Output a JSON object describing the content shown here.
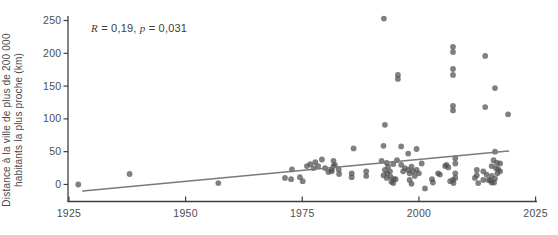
{
  "figure": {
    "background": "#ffffff"
  },
  "annotation_parts": {
    "r_label": "R",
    "r_rest": " = 0,19, ",
    "p_label": "p",
    "p_rest": " = 0,031"
  },
  "chart_data": {
    "type": "scatter",
    "title": "",
    "xlabel": "",
    "ylabel_line1": "Distance à la ville de plus de 200 000",
    "ylabel_line2": "habitants la plus proche (km)",
    "annotation": "R = 0,19, p = 0,031",
    "legend": "none",
    "grid": "off",
    "x_ticks": [
      1925,
      1950,
      1975,
      2000,
      2025
    ],
    "y_ticks": [
      0,
      50,
      100,
      150,
      200,
      250
    ],
    "xlim": [
      1924.8,
      2025.3
    ],
    "ylim": [
      -26,
      263
    ],
    "point_color": "#4f4f4f",
    "point_opacity": 0.72,
    "line_color": "#7a7a7a",
    "axis_color": "#3f3f3f",
    "trend_line": {
      "x1": 1928,
      "y1": -10,
      "x2": 2019.2,
      "y2": 51
    },
    "points": [
      [
        1927,
        0
      ],
      [
        1938,
        16
      ],
      [
        1957,
        2
      ],
      [
        1971.3,
        10
      ],
      [
        1972.6,
        8
      ],
      [
        1972.8,
        23
      ],
      [
        1974.5,
        11
      ],
      [
        1975.1,
        5
      ],
      [
        1976,
        28
      ],
      [
        1976.7,
        31
      ],
      [
        1977.4,
        25
      ],
      [
        1977.8,
        34
      ],
      [
        1978.4,
        28
      ],
      [
        1979.2,
        38
      ],
      [
        1979.9,
        25
      ],
      [
        1980.6,
        19
      ],
      [
        1981.3,
        23
      ],
      [
        1981.3,
        20
      ],
      [
        1981.7,
        36
      ],
      [
        1981.7,
        28
      ],
      [
        1982,
        30
      ],
      [
        1982.8,
        23
      ],
      [
        1982.9,
        16
      ],
      [
        1985.6,
        17
      ],
      [
        1985.6,
        11
      ],
      [
        1986,
        55
      ],
      [
        1988.7,
        20
      ],
      [
        1988.7,
        13
      ],
      [
        1992,
        36
      ],
      [
        1992.4,
        59
      ],
      [
        1992.5,
        253
      ],
      [
        1992.7,
        91
      ],
      [
        1992.7,
        22
      ],
      [
        1992.4,
        14
      ],
      [
        1993.1,
        33
      ],
      [
        1993.4,
        27
      ],
      [
        1993.2,
        17
      ],
      [
        1993.8,
        20
      ],
      [
        1993.1,
        10
      ],
      [
        1993.9,
        12
      ],
      [
        1994.1,
        4
      ],
      [
        1994.6,
        8
      ],
      [
        1994.5,
        31
      ],
      [
        1994.5,
        2
      ],
      [
        1995,
        8
      ],
      [
        1995.3,
        37
      ],
      [
        1995.5,
        167
      ],
      [
        1995.5,
        161
      ],
      [
        1996.2,
        58
      ],
      [
        1996.2,
        30
      ],
      [
        1996.6,
        20
      ],
      [
        1997,
        25
      ],
      [
        1997.7,
        47
      ],
      [
        1997.7,
        22
      ],
      [
        1998,
        17
      ],
      [
        1998,
        7
      ],
      [
        1998.4,
        27
      ],
      [
        1998.4,
        1
      ],
      [
        1998.7,
        20
      ],
      [
        1999.1,
        13
      ],
      [
        1999.5,
        54
      ],
      [
        1999.5,
        22
      ],
      [
        2000,
        17
      ],
      [
        2000.6,
        32
      ],
      [
        2001.3,
        -6
      ],
      [
        2002.8,
        8
      ],
      [
        2003,
        3
      ],
      [
        2004.1,
        17
      ],
      [
        2004.5,
        15
      ],
      [
        2005.6,
        28
      ],
      [
        2005.9,
        30
      ],
      [
        2006.3,
        26
      ],
      [
        2006.7,
        5
      ],
      [
        2007.3,
        7
      ],
      [
        2007.4,
        2
      ],
      [
        2007.8,
        40
      ],
      [
        2007.8,
        32
      ],
      [
        2007.8,
        17
      ],
      [
        2007.8,
        10
      ],
      [
        2007.3,
        210
      ],
      [
        2007.3,
        202
      ],
      [
        2007.3,
        176
      ],
      [
        2007.3,
        167
      ],
      [
        2007.3,
        120
      ],
      [
        2007.3,
        113
      ],
      [
        2012,
        10
      ],
      [
        2012.4,
        22
      ],
      [
        2012.4,
        14
      ],
      [
        2012.7,
        2
      ],
      [
        2013.8,
        20
      ],
      [
        2013.8,
        7
      ],
      [
        2014.2,
        196
      ],
      [
        2014.2,
        118
      ],
      [
        2014.5,
        15
      ],
      [
        2014.9,
        7
      ],
      [
        2015.3,
        6
      ],
      [
        2015.6,
        28
      ],
      [
        2015.6,
        13
      ],
      [
        2015.6,
        3
      ],
      [
        2016,
        37
      ],
      [
        2016.1,
        3
      ],
      [
        2016.3,
        50
      ],
      [
        2016.3,
        147
      ],
      [
        2016.3,
        9
      ],
      [
        2016.5,
        25
      ],
      [
        2016.7,
        33
      ],
      [
        2016.8,
        17
      ],
      [
        2017,
        23
      ],
      [
        2017.4,
        32
      ],
      [
        2017.4,
        20
      ],
      [
        2019.1,
        107
      ]
    ]
  }
}
